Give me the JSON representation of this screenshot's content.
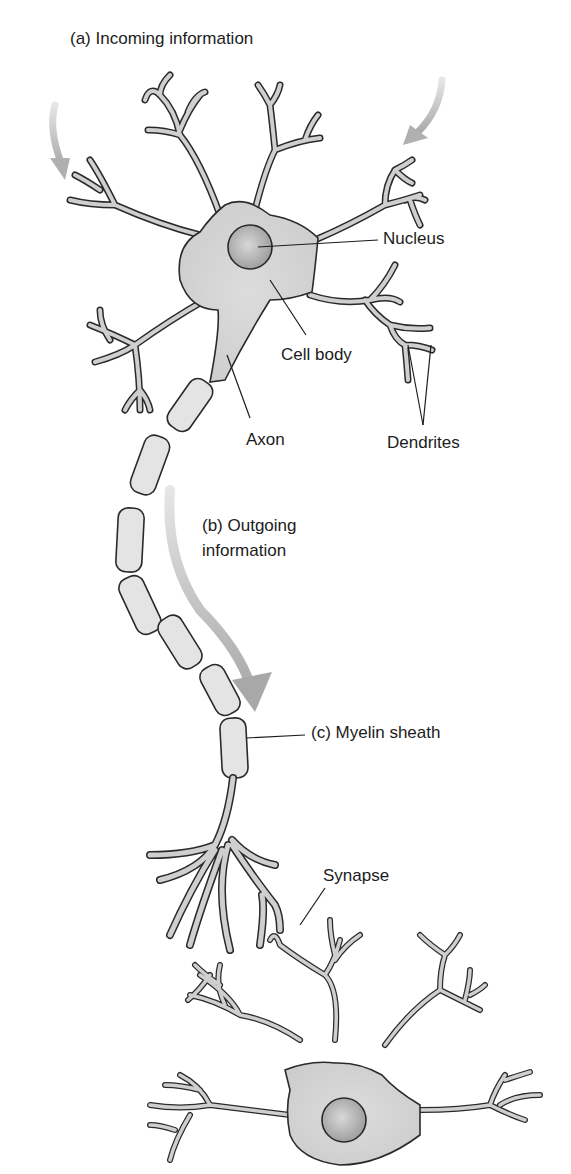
{
  "title": "(a) Incoming information",
  "labels": {
    "nucleus": "Nucleus",
    "cell_body": "Cell body",
    "axon": "Axon",
    "dendrites": "Dendrites",
    "outgoing_line1": "(b) Outgoing",
    "outgoing_line2": "information",
    "myelin": "(c) Myelin sheath",
    "synapse": "Synapse"
  },
  "colors": {
    "cell_fill": "#d6d6d6",
    "outline": "#2a2a2a",
    "arrow": "#b8b8b8",
    "myelin_fill": "#e4e4e4",
    "background": "#ffffff"
  }
}
